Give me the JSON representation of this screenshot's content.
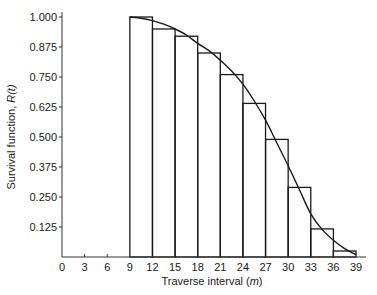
{
  "chart_data": {
    "type": "bar",
    "title": "",
    "xlabel": "Traverse interval (m)",
    "xlabel_parts": {
      "text": "Traverse interval (",
      "italic": "m",
      "close": ")"
    },
    "ylabel": "Survival function, R(t)",
    "ylabel_parts": {
      "text": "Survival function, ",
      "italic": "R(t)"
    },
    "xlim": [
      0,
      39
    ],
    "ylim": [
      0,
      1.0
    ],
    "grid": false,
    "legend": null,
    "x_ticks": [
      0,
      3,
      6,
      9,
      12,
      15,
      18,
      21,
      24,
      27,
      30,
      33,
      36,
      39
    ],
    "y_ticks": [
      "0.125",
      "0.250",
      "0.375",
      "0.500",
      "0.625",
      "0.750",
      "0.875",
      "1.000"
    ],
    "y_tick_values": [
      0.125,
      0.25,
      0.375,
      0.5,
      0.625,
      0.75,
      0.875,
      1.0
    ],
    "series": [
      {
        "name": "Empirical survival (histogram)",
        "type": "bar",
        "bins": [
          {
            "from": 9,
            "to": 12,
            "value": 1.0
          },
          {
            "from": 12,
            "to": 15,
            "value": 0.95
          },
          {
            "from": 15,
            "to": 18,
            "value": 0.92
          },
          {
            "from": 18,
            "to": 21,
            "value": 0.85
          },
          {
            "from": 21,
            "to": 24,
            "value": 0.76
          },
          {
            "from": 24,
            "to": 27,
            "value": 0.64
          },
          {
            "from": 27,
            "to": 30,
            "value": 0.49
          },
          {
            "from": 30,
            "to": 33,
            "value": 0.29
          },
          {
            "from": 33,
            "to": 36,
            "value": 0.117
          },
          {
            "from": 36,
            "to": 39,
            "value": 0.025
          }
        ]
      },
      {
        "name": "Fitted survival curve",
        "type": "line",
        "x": [
          9,
          10.5,
          12,
          13.5,
          15,
          16.5,
          18,
          19.5,
          21,
          22.5,
          24,
          25.5,
          27,
          28.5,
          30,
          31.5,
          33,
          34.5,
          36,
          37.5,
          39
        ],
        "y": [
          1.0,
          0.995,
          0.985,
          0.97,
          0.95,
          0.925,
          0.89,
          0.86,
          0.82,
          0.775,
          0.72,
          0.65,
          0.57,
          0.475,
          0.38,
          0.28,
          0.18,
          0.115,
          0.07,
          0.035,
          0.01
        ]
      }
    ]
  }
}
